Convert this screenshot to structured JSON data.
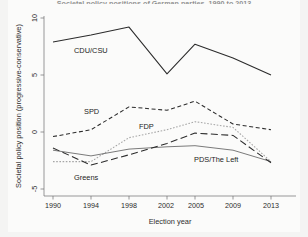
{
  "figure": {
    "title": "Societal policy positions of German parties, 1990 to 2013",
    "title_clipped": true,
    "background_color": "#fbfbfa",
    "ink_color": "#2b2b2b"
  },
  "axes": {
    "x_label": "Election year",
    "y_label": "Societal policy position (progressive-conservative)",
    "x_ticks": [
      "1990",
      "1994",
      "1998",
      "2002",
      "2005",
      "2009",
      "2013"
    ],
    "y_ticks": [
      "10",
      "5",
      "0",
      "-5"
    ]
  },
  "series_labels": {
    "cdu": "CDU/CSU",
    "spd": "SPD",
    "fdp": "FDP",
    "greens": "Greens",
    "left": "PDS/The Left"
  },
  "chart_data": {
    "type": "line",
    "title": "Societal policy positions of German parties, 1990 to 2013",
    "xlabel": "Election year",
    "ylabel": "Societal policy position (progressive-conservative)",
    "x": [
      1990,
      1994,
      1998,
      2002,
      2005,
      2009,
      2013
    ],
    "xlim": [
      1990,
      2013
    ],
    "ylim": [
      -5,
      10
    ],
    "ytick_values": [
      10,
      5,
      0,
      -5
    ],
    "grid": false,
    "legend": "inline-labels",
    "series": [
      {
        "name": "CDU/CSU",
        "style": "solid",
        "color": "#2b2b2b",
        "values": [
          7.9,
          8.5,
          9.2,
          5.1,
          7.7,
          6.5,
          5.0
        ]
      },
      {
        "name": "SPD",
        "style": "dashed",
        "color": "#2b2b2b",
        "values": [
          -0.4,
          0.2,
          2.2,
          1.9,
          2.7,
          0.7,
          0.2
        ]
      },
      {
        "name": "FDP",
        "style": "dotted",
        "color": "#9a9a9a",
        "values": [
          -2.6,
          -2.6,
          -0.5,
          0.2,
          0.9,
          0.4,
          -2.6
        ]
      },
      {
        "name": "Greens",
        "style": "thin-solid",
        "color": "#4a4a4a",
        "values": [
          -1.6,
          -2.1,
          -1.5,
          -1.3,
          -1.2,
          -1.6,
          -2.6
        ]
      },
      {
        "name": "PDS/The Left",
        "style": "long-dash",
        "color": "#2b2b2b",
        "values": [
          -1.4,
          -2.9,
          -2.0,
          -1.0,
          -0.1,
          -0.3,
          -2.7
        ]
      }
    ]
  }
}
